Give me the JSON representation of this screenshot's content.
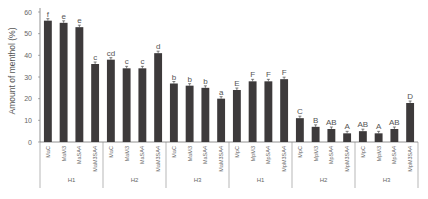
{
  "chart_data": {
    "type": "bar",
    "title": "",
    "xlabel": "",
    "ylabel": "Amount of menthol (%)",
    "ylim": [
      0,
      60
    ],
    "yticks": [
      0,
      10,
      20,
      30,
      40,
      50,
      60
    ],
    "grid": false,
    "bar_color": "#3d3a3b",
    "categories": [
      "MaC",
      "MaM3",
      "MaSA4",
      "MaM3SA4",
      "MaC",
      "MaM3",
      "MaSA4",
      "MaM3SA4",
      "MaC",
      "MaM3",
      "MaSA4",
      "MaM3SA4",
      "MpC",
      "MpM3",
      "MpSA4",
      "MpM3SA4",
      "MpC",
      "MpM3",
      "MpSA4",
      "MpM3SA4",
      "MpC",
      "MpM3",
      "MpSA4",
      "MpM3SA4"
    ],
    "groups": [
      {
        "label": "H1",
        "start": 0,
        "count": 4
      },
      {
        "label": "H2",
        "start": 4,
        "count": 4
      },
      {
        "label": "H3",
        "start": 8,
        "count": 4
      },
      {
        "label": "H1",
        "start": 12,
        "count": 4
      },
      {
        "label": "H2",
        "start": 16,
        "count": 4
      },
      {
        "label": "H3",
        "start": 20,
        "count": 4
      }
    ],
    "values": [
      56,
      55,
      53,
      36,
      38,
      34,
      34,
      41,
      27,
      26,
      25,
      20,
      24,
      28,
      28,
      29,
      11,
      7,
      6,
      4,
      5,
      4,
      6,
      18
    ],
    "annotations": [
      "f",
      "e",
      "e",
      "c",
      "cd",
      "c",
      "c",
      "d",
      "b",
      "b",
      "b",
      "a",
      "E",
      "F",
      "F",
      "F",
      "C",
      "B",
      "AB",
      "A",
      "AB",
      "A",
      "AB",
      "D"
    ]
  }
}
